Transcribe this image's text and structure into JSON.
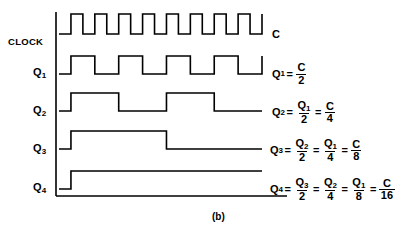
{
  "figure": {
    "caption": "(b)",
    "rows": [
      {
        "name": "clock",
        "label": "CLOCK",
        "label_base": "CLOCK",
        "label_sub": "",
        "signal_label": "C",
        "divider": 1,
        "pulses": 8,
        "initial_state": "low"
      },
      {
        "name": "q1",
        "label": "Q1",
        "label_base": "Q",
        "label_sub": "1",
        "divider": 2,
        "pulses": 4,
        "initial_state": "low"
      },
      {
        "name": "q2",
        "label": "Q2",
        "label_base": "Q",
        "label_sub": "2",
        "divider": 4,
        "pulses": 2,
        "initial_state": "low"
      },
      {
        "name": "q3",
        "label": "Q3",
        "label_base": "Q",
        "label_sub": "3",
        "divider": 8,
        "pulses": 1,
        "initial_state": "low"
      },
      {
        "name": "q4",
        "label": "Q4",
        "label_base": "Q",
        "label_sub": "4",
        "divider": 16,
        "pulses": 0.5,
        "initial_state": "low"
      }
    ],
    "equations": [
      {
        "name": "clock-equation",
        "lhs_base": "C",
        "lhs_sub": "",
        "text": "C",
        "terms": []
      },
      {
        "name": "q1-equation",
        "lhs_base": "Q",
        "lhs_sub": "1",
        "text": "Q1 = C/2",
        "terms": [
          {
            "num_base": "C",
            "num_sub": "",
            "den": "2"
          }
        ]
      },
      {
        "name": "q2-equation",
        "lhs_base": "Q",
        "lhs_sub": "2",
        "text": "Q2 = Q1/2 = C/4",
        "terms": [
          {
            "num_base": "Q",
            "num_sub": "1",
            "den": "2"
          },
          {
            "num_base": "C",
            "num_sub": "",
            "den": "4"
          }
        ]
      },
      {
        "name": "q3-equation",
        "lhs_base": "Q",
        "lhs_sub": "3",
        "text": "Q3 = Q2/2 = Q1/4 = C/8",
        "terms": [
          {
            "num_base": "Q",
            "num_sub": "2",
            "den": "2"
          },
          {
            "num_base": "Q",
            "num_sub": "1",
            "den": "4"
          },
          {
            "num_base": "C",
            "num_sub": "",
            "den": "8"
          }
        ]
      },
      {
        "name": "q4-equation",
        "lhs_base": "Q",
        "lhs_sub": "4",
        "text": "Q4 = Q3/2 = Q2/4 = Q1/8 = C/16",
        "terms": [
          {
            "num_base": "Q",
            "num_sub": "3",
            "den": "2"
          },
          {
            "num_base": "Q",
            "num_sub": "2",
            "den": "4"
          },
          {
            "num_base": "Q",
            "num_sub": "1",
            "den": "8"
          },
          {
            "num_base": "C",
            "num_sub": "",
            "den": "16"
          }
        ]
      }
    ],
    "equals_sign": "=",
    "colors": {
      "line": "#000000",
      "background": "#ffffff",
      "text": "#000000"
    },
    "geometry": {
      "axis_x": 56,
      "wave_start_x": 59,
      "wave_end_x": 262,
      "baseline_y": 196,
      "baseline_x1": 56,
      "baseline_x2": 287,
      "axis_y_top": 12,
      "axis_y_bottom": 196,
      "stroke_width": 1.6,
      "rows_y": [
        {
          "low": 34,
          "high": 14
        },
        {
          "low": 74,
          "high": 56
        },
        {
          "low": 111,
          "high": 93
        },
        {
          "low": 149,
          "high": 131
        },
        {
          "low": 189,
          "high": 171
        }
      ]
    }
  }
}
